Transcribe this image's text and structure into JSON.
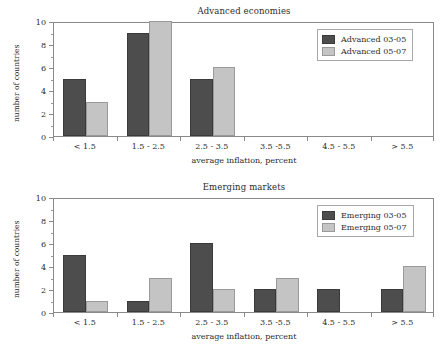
{
  "chart_data": [
    {
      "type": "bar",
      "title": "Advanced economies",
      "xlabel": "average inflation, percent",
      "ylabel": "number of countries",
      "categories": [
        "< 1.5",
        "1.5 - 2.5",
        "2.5 - 3.5",
        "3.5 -5.5",
        "4.5 - 5.5",
        "> 5.5"
      ],
      "series": [
        {
          "name": "Advanced 03-05",
          "color": "#4d4d4d",
          "values": [
            5,
            9,
            5,
            0,
            0,
            0
          ]
        },
        {
          "name": "Advanced 05-07",
          "color": "#c4c4c4",
          "values": [
            3,
            10,
            6,
            0,
            0,
            0
          ]
        }
      ],
      "ylim": [
        0,
        10
      ],
      "yticks": [
        0,
        2,
        4,
        6,
        8,
        10
      ],
      "yticks_minor": [
        1,
        3,
        5,
        7,
        9
      ],
      "grid": false,
      "legend_position": "top-right"
    },
    {
      "type": "bar",
      "title": "Emerging markets",
      "xlabel": "average inflation, percent",
      "ylabel": "number of countries",
      "categories": [
        "< 1.5",
        "1.5 - 2.5",
        "2.5 - 3.5",
        "3.5 -5.5",
        "4.5 - 5.5",
        "> 5.5"
      ],
      "series": [
        {
          "name": "Emerging 03-05",
          "color": "#4d4d4d",
          "values": [
            5,
            1,
            6,
            2,
            2,
            2
          ]
        },
        {
          "name": "Emerging 05-07",
          "color": "#c4c4c4",
          "values": [
            1,
            3,
            2,
            3,
            0,
            4
          ]
        }
      ],
      "ylim": [
        0,
        10
      ],
      "yticks": [
        0,
        2,
        4,
        6,
        8,
        10
      ],
      "yticks_minor": [
        1,
        3,
        5,
        7,
        9
      ],
      "grid": false,
      "legend_position": "top-right"
    }
  ]
}
